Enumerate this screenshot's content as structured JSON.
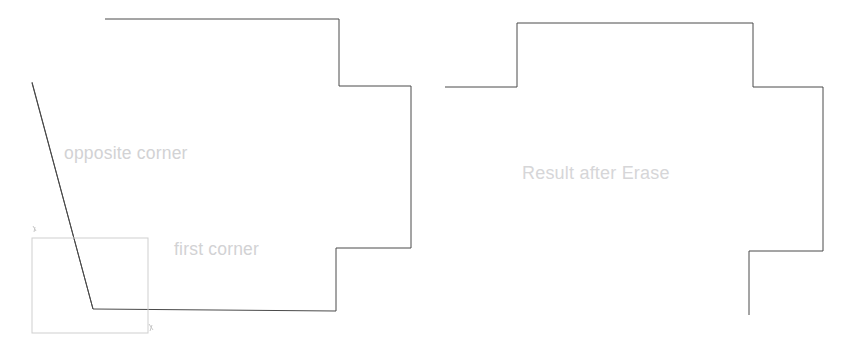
{
  "canvas": {
    "width": 856,
    "height": 354,
    "background_color": "#ffffff"
  },
  "style": {
    "outline_stroke_color": "#4a4a4a",
    "outline_stroke_width": 1,
    "selection_stroke_color": "#cfcfcf",
    "selection_stroke_width": 1,
    "label_color": "#d2d2d4",
    "cursor_mark_color": "#c8c8c8"
  },
  "figures": {
    "left": {
      "name": "shape-before-erase",
      "description": "Polygon with a diagonal cut crossing its lower-left side, shown with an active crossing-selection window",
      "outline_points": "105,19 339,19 339,86 411,86 411,248 336,248 336,311 93,309 32,82",
      "diagonal_points": "32,83 93,309",
      "selection_rect": {
        "x": 32,
        "y": 238,
        "width": 116,
        "height": 95
      },
      "cursor_marks": [
        {
          "name": "first-corner-marker",
          "x": 33,
          "y": 229
        },
        {
          "name": "opposite-corner-marker",
          "x": 150,
          "y": 327
        }
      ],
      "labels": [
        {
          "id": "opposite-corner",
          "text": "opposite corner",
          "x": 64,
          "y": 143
        },
        {
          "id": "first-corner",
          "text": "first corner",
          "x": 174,
          "y": 239
        }
      ]
    },
    "right": {
      "name": "shape-after-erase",
      "description": "Same polygon after the Erase command removed the segments inside the selection window, leaving open gaps",
      "outline_points": "445,87 517,87 517,23 753,23 753,87 823,87 823,251 749,251 749,315",
      "labels": [
        {
          "id": "result-after-erase",
          "text": "Result after Erase",
          "x": 522,
          "y": 163
        }
      ]
    }
  },
  "text": {
    "opposite_corner": "opposite corner",
    "first_corner": "first corner",
    "result_after_erase": "Result after Erase"
  }
}
